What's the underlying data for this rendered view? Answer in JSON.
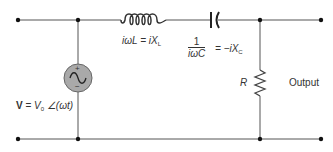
{
  "diagram": {
    "components": {
      "inductor": {
        "label_pre": "iωL = iX",
        "label_sub": "L"
      },
      "capacitor": {
        "numerator": "1",
        "denominator": "iωC",
        "label_post": "= −iX",
        "label_sub": "C"
      },
      "resistor": {
        "label": "R"
      },
      "source": {
        "plus": "+",
        "minus": "−",
        "label_bold": "V",
        "label_eq": " = ",
        "label_v": "V",
        "label_v_sub": "0",
        "label_angle": " ∠(ωt)"
      },
      "output": {
        "label": "Output"
      }
    },
    "colors": {
      "wire": "#555555",
      "source_fill": "#a9a9a9",
      "text": "#333333"
    }
  }
}
